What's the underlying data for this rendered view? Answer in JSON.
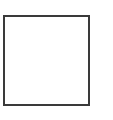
{
  "diagram": {
    "shapes": [
      {
        "type": "square",
        "stroke": "#3a3a3a",
        "fill": "#ffffff"
      }
    ]
  }
}
